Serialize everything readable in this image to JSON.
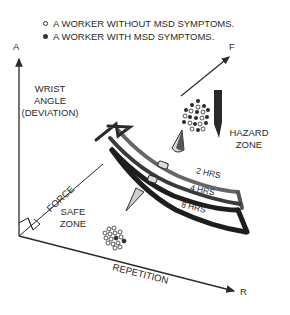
{
  "legend": {
    "items": [
      {
        "marker": "open-circle",
        "label": "A WORKER WITHOUT MSD SYMPTOMS."
      },
      {
        "marker": "filled-circle",
        "label": "A WORKER WITH MSD SYMPTOMS."
      }
    ]
  },
  "axes": {
    "vertical_letter": "A",
    "diagonal_letter": "F",
    "horizontal_letter": "R",
    "vertical_label_line1": "WRIST",
    "vertical_label_line2": "ANGLE",
    "vertical_label_line3": "(DEVIATION)",
    "force_label": "FORCE",
    "repetition_label": "REPETITION"
  },
  "zones": {
    "hazard_line1": "HAZARD",
    "hazard_line2": "ZONE",
    "safe_line1": "SAFE",
    "safe_line2": "ZONE"
  },
  "bands": [
    {
      "label": "2 HRS"
    },
    {
      "label": "4 HRS"
    },
    {
      "label": "8 HRS"
    }
  ],
  "colors": {
    "ink": "#2a2a2a",
    "band_dark": "#1e1e1e",
    "band_mid": "#555555",
    "background": "#ffffff"
  }
}
